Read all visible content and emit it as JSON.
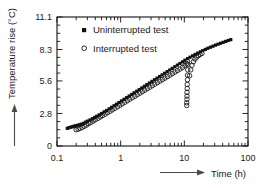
{
  "chart_data": {
    "type": "scatter",
    "title": "",
    "xlabel": "Time (h)",
    "ylabel": "Temperature rise (°C)",
    "xscale": "log",
    "yscale": "linear",
    "xlim": [
      0.1,
      100
    ],
    "ylim": [
      0,
      11.1
    ],
    "xticks": [
      0.1,
      1,
      10,
      100
    ],
    "xticklabels": [
      "0.1",
      "1",
      "10",
      "100"
    ],
    "yticks": [
      0,
      2.8,
      5.6,
      8.3,
      11.1
    ],
    "yticklabels": [
      "0",
      "2.8",
      "5.6",
      "8.3",
      "11.1"
    ],
    "grid": false,
    "minor_ticks": true,
    "legend_position": "upper-left-inside",
    "series": [
      {
        "name": "Uninterrupted test",
        "marker": "filled-square",
        "color": "#111111",
        "points": [
          [
            0.145,
            1.52
          ],
          [
            0.155,
            1.58
          ],
          [
            0.165,
            1.62
          ],
          [
            0.175,
            1.66
          ],
          [
            0.185,
            1.7
          ],
          [
            0.195,
            1.74
          ],
          [
            0.21,
            1.78
          ],
          [
            0.225,
            1.82
          ],
          [
            0.24,
            1.88
          ],
          [
            0.26,
            1.95
          ],
          [
            0.28,
            2.05
          ],
          [
            0.3,
            2.14
          ],
          [
            0.33,
            2.24
          ],
          [
            0.36,
            2.35
          ],
          [
            0.39,
            2.46
          ],
          [
            0.42,
            2.56
          ],
          [
            0.46,
            2.68
          ],
          [
            0.5,
            2.8
          ],
          [
            0.55,
            2.94
          ],
          [
            0.6,
            3.06
          ],
          [
            0.66,
            3.2
          ],
          [
            0.72,
            3.33
          ],
          [
            0.79,
            3.47
          ],
          [
            0.86,
            3.6
          ],
          [
            0.94,
            3.74
          ],
          [
            1.03,
            3.88
          ],
          [
            1.13,
            4.02
          ],
          [
            1.24,
            4.16
          ],
          [
            1.36,
            4.3
          ],
          [
            1.49,
            4.44
          ],
          [
            1.63,
            4.58
          ],
          [
            1.79,
            4.72
          ],
          [
            1.96,
            4.86
          ],
          [
            2.15,
            5.0
          ],
          [
            2.36,
            5.14
          ],
          [
            2.58,
            5.28
          ],
          [
            2.83,
            5.42
          ],
          [
            3.1,
            5.56
          ],
          [
            3.4,
            5.7
          ],
          [
            3.73,
            5.84
          ],
          [
            4.09,
            5.98
          ],
          [
            4.48,
            6.12
          ],
          [
            4.91,
            6.26
          ],
          [
            5.38,
            6.4
          ],
          [
            5.9,
            6.54
          ],
          [
            6.47,
            6.68
          ],
          [
            7.09,
            6.82
          ],
          [
            7.77,
            6.96
          ],
          [
            8.52,
            7.1
          ],
          [
            9.34,
            7.24
          ],
          [
            10.2,
            7.38
          ],
          [
            11.2,
            7.52
          ],
          [
            12.3,
            7.64
          ],
          [
            13.5,
            7.76
          ],
          [
            14.8,
            7.88
          ],
          [
            16.2,
            7.99
          ],
          [
            17.8,
            8.1
          ],
          [
            19.5,
            8.21
          ],
          [
            21.4,
            8.31
          ],
          [
            23.4,
            8.41
          ],
          [
            25.7,
            8.5
          ],
          [
            28.2,
            8.59
          ],
          [
            30.9,
            8.68
          ],
          [
            33.8,
            8.76
          ],
          [
            37.1,
            8.84
          ],
          [
            40.7,
            8.92
          ],
          [
            44.6,
            9.0
          ],
          [
            48.9,
            9.08
          ],
          [
            53.6,
            9.15
          ]
        ]
      },
      {
        "name": "Interrupted test",
        "marker": "open-circle",
        "color": "#111111",
        "points": [
          [
            0.2,
            1.4
          ],
          [
            0.215,
            1.45
          ],
          [
            0.23,
            1.52
          ],
          [
            0.25,
            1.6
          ],
          [
            0.27,
            1.7
          ],
          [
            0.29,
            1.8
          ],
          [
            0.315,
            1.92
          ],
          [
            0.34,
            2.03
          ],
          [
            0.37,
            2.15
          ],
          [
            0.4,
            2.26
          ],
          [
            0.44,
            2.38
          ],
          [
            0.48,
            2.5
          ],
          [
            0.52,
            2.62
          ],
          [
            0.57,
            2.74
          ],
          [
            0.62,
            2.86
          ],
          [
            0.68,
            2.99
          ],
          [
            0.74,
            3.11
          ],
          [
            0.81,
            3.24
          ],
          [
            0.89,
            3.37
          ],
          [
            0.97,
            3.5
          ],
          [
            1.06,
            3.63
          ],
          [
            1.16,
            3.76
          ],
          [
            1.27,
            3.89
          ],
          [
            1.39,
            4.02
          ],
          [
            1.52,
            4.15
          ],
          [
            1.67,
            4.28
          ],
          [
            1.82,
            4.41
          ],
          [
            2.0,
            4.54
          ],
          [
            2.19,
            4.67
          ],
          [
            2.39,
            4.8
          ],
          [
            2.62,
            4.93
          ],
          [
            2.87,
            5.06
          ],
          [
            3.14,
            5.19
          ],
          [
            3.44,
            5.32
          ],
          [
            3.77,
            5.45
          ],
          [
            4.13,
            5.58
          ],
          [
            4.52,
            5.71
          ],
          [
            4.95,
            5.84
          ],
          [
            5.42,
            5.97
          ],
          [
            5.94,
            6.1
          ],
          [
            6.5,
            6.23
          ],
          [
            7.12,
            6.36
          ],
          [
            7.8,
            6.49
          ],
          [
            8.54,
            6.62
          ],
          [
            9.36,
            6.76
          ],
          [
            10.2,
            6.92
          ],
          [
            10.9,
            7.1
          ],
          [
            11.2,
            7.3
          ],
          [
            11.3,
            7.0
          ],
          [
            11.3,
            6.55
          ],
          [
            11.2,
            6.1
          ],
          [
            11.2,
            5.7
          ],
          [
            11.1,
            5.3
          ],
          [
            11.1,
            4.95
          ],
          [
            11.0,
            4.62
          ],
          [
            11.0,
            4.3
          ],
          [
            11.0,
            4.02
          ],
          [
            10.9,
            3.72
          ],
          [
            10.9,
            3.48
          ],
          [
            12.1,
            6.05
          ],
          [
            12.6,
            6.55
          ],
          [
            13.2,
            6.95
          ],
          [
            13.9,
            7.25
          ],
          [
            14.7,
            7.48
          ],
          [
            15.6,
            7.65
          ],
          [
            16.6,
            7.78
          ],
          [
            17.7,
            7.88
          ],
          [
            18.9,
            7.97
          ]
        ]
      }
    ]
  },
  "legend": {
    "items": [
      {
        "label": "Uninterrupted test",
        "marker": "filled-square"
      },
      {
        "label": "Interrupted test",
        "marker": "open-circle"
      }
    ]
  },
  "axes": {
    "x_label": "Time (h)",
    "y_label": "Temperature rise (°C)",
    "x_tick_labels": [
      "0.1",
      "1",
      "10",
      "100"
    ],
    "y_tick_labels": [
      "0",
      "2.8",
      "5.6",
      "8.3",
      "11.1"
    ]
  },
  "colors": {
    "ink": "#111111",
    "background": "#ffffff",
    "arrow": "#4a4a4a"
  }
}
